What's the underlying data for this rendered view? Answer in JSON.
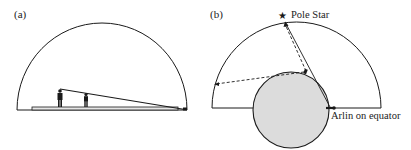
{
  "panels": [
    {
      "id": "a",
      "label": "(a)"
    },
    {
      "id": "b",
      "label": "(b)",
      "annotations": {
        "star_label": "Pole Star",
        "observer_label": "Arlin on equator"
      },
      "icons": {
        "star": "★"
      }
    }
  ],
  "colors": {
    "stroke": "#1a1a1a",
    "earth_fill": "#dcdcdc",
    "platform_fill": "#e6e6e6"
  }
}
